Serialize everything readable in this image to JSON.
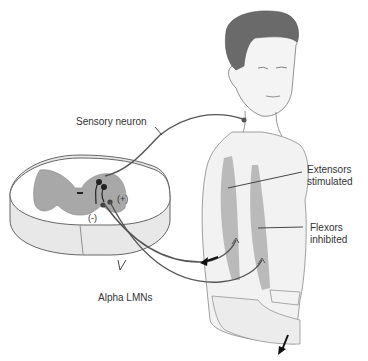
{
  "diagram": {
    "labels": {
      "sensory_neuron": "Sensory neuron",
      "extensors_line1": "Extensors",
      "extensors_line2": "stimulated",
      "flexors_line1": "Flexors",
      "flexors_line2": "inhibited",
      "alpha_lmns": "Alpha LMNs",
      "plus": "(+)",
      "minus": "(-)"
    },
    "colors": {
      "line": "#555555",
      "grey_matter": "#a8a8a8",
      "skin": "#f2f2f2",
      "muscle": "#b0b0b0",
      "hair": "#6a6a6a"
    }
  }
}
